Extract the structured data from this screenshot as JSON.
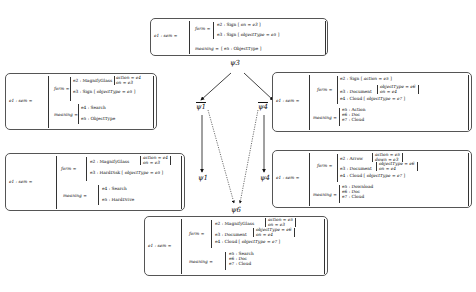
{
  "diagram": {
    "labels": {
      "top": "ψ3",
      "mid_left": "ψ1",
      "mid_right": "ψ4",
      "lower_left": "ψ1",
      "lower_right": "ψ4",
      "bottom": "ψ6"
    },
    "nodes": {
      "top": {
        "lhs": "e1 : sem =",
        "form_label": "form =",
        "meaning_label": "meaning =",
        "form": [
          {
            "entity": "e2 : Sign",
            "attrs": [
              "on = e3"
            ]
          },
          {
            "entity": "e3 : Sign",
            "attrs": [
              "objectType = e5"
            ]
          }
        ],
        "meaning": [
          "e5 : ObjectType"
        ]
      },
      "mid_left": {
        "lhs": "e1 : sem =",
        "form_label": "form =",
        "meaning_label": "meaning =",
        "form": [
          {
            "entity": "e2 : MagnifyGlass",
            "attrs": [
              "action = e4",
              "on = e3"
            ]
          },
          {
            "entity": "e3 : Sign",
            "attrs": [
              "objectType = e5"
            ]
          }
        ],
        "meaning": [
          "e4 : Search",
          "e5 : ObjectType"
        ]
      },
      "mid_right": {
        "lhs": "e1 : sem =",
        "form_label": "form =",
        "meaning_label": "meaning =",
        "form": [
          {
            "entity": "e2 : Sign",
            "attrs": [
              "action = e5"
            ]
          },
          {
            "entity": "e3 : Document",
            "attrs": [
              "objectType = e6",
              "on = e4"
            ]
          },
          {
            "entity": "e4 : Cloud",
            "attrs": [
              "objectType = e7"
            ]
          }
        ],
        "meaning": [
          "e5 : Action",
          "e6 : Doc",
          "e7 : Cloud"
        ]
      },
      "lower_left": {
        "lhs": "e1 : sem =",
        "form_label": "form =",
        "meaning_label": "meaning =",
        "form": [
          {
            "entity": "e2 : MagnifyGlass",
            "attrs": [
              "action = e4",
              "on = e3"
            ]
          },
          {
            "entity": "e3 : HardDisk",
            "attrs": [
              "objectType = e5"
            ]
          }
        ],
        "meaning": [
          "e4 : Search",
          "e5 : HardDrive"
        ]
      },
      "lower_right": {
        "lhs": "e1 : sem =",
        "form_label": "form =",
        "meaning_label": "meaning =",
        "form": [
          {
            "entity": "e2 : Arrow",
            "attrs": [
              "action = e5",
              "down = e3"
            ]
          },
          {
            "entity": "e3 : Document",
            "attrs": [
              "objectType = e6",
              "on = e4"
            ]
          },
          {
            "entity": "e4 : Cloud",
            "attrs": [
              "objectType = e7"
            ]
          }
        ],
        "meaning": [
          "e5 : Download",
          "e6 : Doc",
          "e7 : Cloud"
        ]
      },
      "bottom": {
        "lhs": "e1 : sem =",
        "form_label": "form =",
        "meaning_label": "meaning =",
        "form": [
          {
            "entity": "e2 : MagnifyGlass",
            "attrs": [
              "action = e5",
              "on = e3"
            ]
          },
          {
            "entity": "e3 : Document",
            "attrs": [
              "objectType = e6",
              "on = e4"
            ]
          },
          {
            "entity": "e4 : Cloud",
            "attrs": [
              "objectType = e7"
            ]
          }
        ],
        "meaning": [
          "e5 : Search",
          "e6 : Doc",
          "e7 : Cloud"
        ]
      }
    }
  }
}
